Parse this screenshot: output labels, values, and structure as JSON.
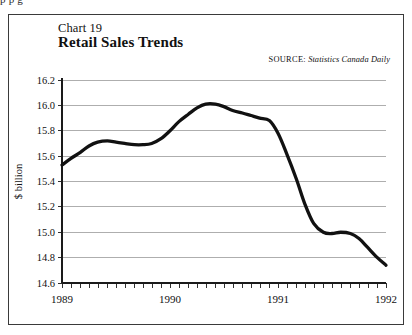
{
  "page": {
    "clipped_text_above_figure": "p p g",
    "background_color": "#ffffff",
    "frame_color": "#3a3a3a"
  },
  "figure": {
    "chart_number_label": "Chart 19",
    "title": "Retail Sales Trends",
    "source_kicker": "SOURCE:",
    "source_body": "Statistics Canada Daily"
  },
  "chart_data": {
    "type": "line",
    "title": "Retail Sales Trends",
    "subtitle": "Chart 19",
    "xlabel": "",
    "ylabel": "$ billion",
    "ylim": [
      14.6,
      16.2
    ],
    "xlim": [
      1989,
      1992
    ],
    "grid": true,
    "legend": false,
    "line_color": "#111111",
    "ytick_labels": [
      "16.2",
      "16.0",
      "15.8",
      "15.6",
      "15.4",
      "15.2",
      "15.0",
      "14.8",
      "14.6"
    ],
    "ytick_values": [
      16.2,
      16.0,
      15.8,
      15.6,
      15.4,
      15.2,
      15.0,
      14.8,
      14.6
    ],
    "xtick_labels": [
      "1989",
      "1990",
      "1991",
      "1992"
    ],
    "xtick_values": [
      1989,
      1990,
      1991,
      1992
    ],
    "minor_xticks_per_year": 12,
    "series": [
      {
        "name": "Retail sales",
        "x": [
          1989.0,
          1989.08,
          1989.17,
          1989.25,
          1989.33,
          1989.42,
          1989.5,
          1989.58,
          1989.67,
          1989.75,
          1989.83,
          1989.92,
          1990.0,
          1990.08,
          1990.17,
          1990.25,
          1990.33,
          1990.42,
          1990.5,
          1990.58,
          1990.67,
          1990.75,
          1990.83,
          1990.92,
          1991.0,
          1991.08,
          1991.17,
          1991.25,
          1991.33,
          1991.42,
          1991.5,
          1991.58,
          1991.67,
          1991.75,
          1991.83,
          1991.92,
          1992.0
        ],
        "values": [
          15.53,
          15.58,
          15.63,
          15.68,
          15.71,
          15.72,
          15.71,
          15.7,
          15.69,
          15.69,
          15.7,
          15.74,
          15.8,
          15.87,
          15.93,
          15.98,
          16.01,
          16.01,
          15.99,
          15.96,
          15.94,
          15.92,
          15.9,
          15.88,
          15.78,
          15.62,
          15.42,
          15.22,
          15.07,
          15.0,
          14.99,
          15.0,
          14.99,
          14.95,
          14.88,
          14.8,
          14.74
        ]
      }
    ],
    "annotations": [
      {
        "label": "start",
        "x": 1989.0,
        "y": 15.53
      },
      {
        "label": "peak",
        "x": 1990.4,
        "y": 16.01
      },
      {
        "label": "plateau",
        "x": 1991.5,
        "y": 15.0
      },
      {
        "label": "end",
        "x": 1992.0,
        "y": 14.74
      }
    ]
  },
  "geometry": {
    "plot_left": 62,
    "plot_right": 386,
    "plot_top": 80,
    "plot_bottom": 283
  }
}
